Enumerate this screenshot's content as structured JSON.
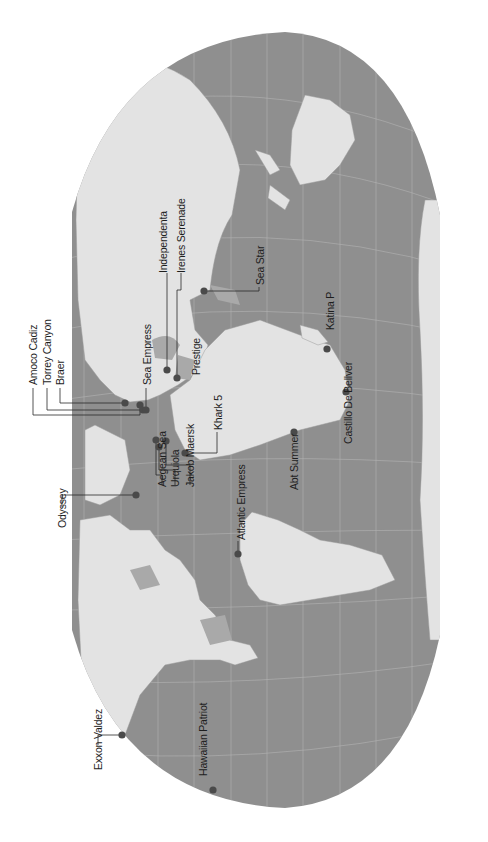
{
  "map": {
    "title": "",
    "colors": {
      "ocean": "#8f8f8f",
      "land": "#e3e3e3",
      "inland_water": "#a9a9a9",
      "marker": "#4a4a4a",
      "leader": "#2a2a2a",
      "graticule": "#b5b5b5"
    },
    "orientation": "rotated 90 degrees counter-clockwise",
    "markers": [
      {
        "name": "Amoco Cadiz",
        "dot": [
          140,
          405
        ],
        "label": [
          33,
          385
        ],
        "path": "M140,405 L140,415 L33,415 L33,388"
      },
      {
        "name": "Torrey Canyon",
        "dot": [
          143,
          410
        ],
        "label": [
          47,
          385
        ],
        "path": "M143,410 L47,410 L47,388"
      },
      {
        "name": "Braer",
        "dot": [
          125,
          403
        ],
        "label": [
          60,
          385
        ],
        "path": "M125,403 L60,403 L60,388"
      },
      {
        "name": "Sea Empress",
        "dot": [
          146,
          410
        ],
        "label": [
          147,
          385
        ],
        "path": "M146,410 L146,388"
      },
      {
        "name": "Independenta",
        "dot": [
          167,
          370
        ],
        "label": [
          163,
          273
        ],
        "path": "M167,370 L167,273"
      },
      {
        "name": "Irenes Serenade",
        "dot": [
          177,
          378
        ],
        "label": [
          181,
          273
        ],
        "path": "M177,378 L177,290 L181,290 L181,273"
      },
      {
        "name": "Prestige",
        "dot": null,
        "label": [
          196,
          375
        ],
        "path": ""
      },
      {
        "name": "Khark 5",
        "dot": [
          185,
          453
        ],
        "label": [
          218,
          430
        ],
        "path": "M185,453 L217,453 L217,432"
      },
      {
        "name": "Sea Star",
        "dot": [
          204,
          291
        ],
        "label": [
          260,
          285
        ],
        "path": "M204,291 L259,291 L259,287"
      },
      {
        "name": "Katina P",
        "dot": [
          327,
          349
        ],
        "label": [
          330,
          330
        ],
        "path": ""
      },
      {
        "name": "Castillo De Bellver",
        "dot": [
          346,
          392
        ],
        "label": [
          348,
          444
        ],
        "path": ""
      },
      {
        "name": "Abt Summer",
        "dot": [
          294,
          432
        ],
        "label": [
          294,
          490
        ],
        "path": ""
      },
      {
        "name": "Atlantic Empress",
        "dot": [
          238,
          554
        ],
        "label": [
          241,
          540
        ],
        "path": "M238,554 L238,541"
      },
      {
        "name": "Aegean Sea",
        "dot": [
          156,
          440
        ],
        "label": [
          162,
          487
        ],
        "path": "M156,440 L156,475 L162,475 L162,485"
      },
      {
        "name": "Urquiola",
        "dot": [
          159,
          447
        ],
        "label": [
          175,
          487
        ],
        "path": "M159,447 L159,470 L175,470 L175,485"
      },
      {
        "name": "Jakob Maersk",
        "dot": [
          166,
          441
        ],
        "label": [
          190,
          487
        ],
        "path": "M166,441 L166,465 L190,465 L190,485"
      },
      {
        "name": "Odyssey",
        "dot": [
          136,
          495
        ],
        "label": [
          62,
          528
        ],
        "path": "M136,495 L62,495 L62,507"
      },
      {
        "name": "Exxon Valdez",
        "dot": [
          122,
          735
        ],
        "label": [
          98,
          770
        ],
        "path": "M122,735 L98,735 L98,745"
      },
      {
        "name": "Hawaiian Patriot",
        "dot": [
          213,
          790
        ],
        "label": [
          203,
          776
        ],
        "path": ""
      }
    ]
  }
}
